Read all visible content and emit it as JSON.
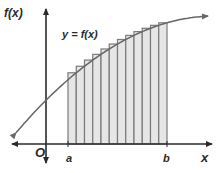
{
  "diagram": {
    "curve_label": "y = f(x)",
    "y_axis_label": "f(x)",
    "x_axis_label": "x",
    "origin_label": "O",
    "lower_bound_label": "a",
    "upper_bound_label": "b",
    "rectangle_count": 12,
    "colors": {
      "axis": "#2a2a2a",
      "curve": "#666666",
      "rect_fill": "#e6e6e6",
      "rect_stroke": "#7a7a7a"
    }
  }
}
